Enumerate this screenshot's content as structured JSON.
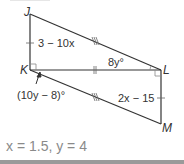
{
  "figure": {
    "vertices": {
      "J": {
        "label": "J",
        "x": 30,
        "y": 14
      },
      "K": {
        "label": "K",
        "x": 30,
        "y": 70
      },
      "L": {
        "label": "L",
        "x": 161,
        "y": 70
      },
      "M": {
        "label": "M",
        "x": 161,
        "y": 124
      }
    },
    "labels": {
      "jk_length": "3 − 10x",
      "angle_jlk": "8y°",
      "angle_lkm": "(10y − 8)°",
      "lm_length": "2x − 15"
    },
    "line_color": "#333333",
    "text_color": "#333333"
  },
  "answer": {
    "text": "x = 1.5, y = 4",
    "color": "#8a8a8a"
  }
}
